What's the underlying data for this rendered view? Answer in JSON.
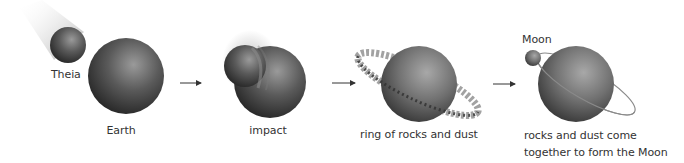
{
  "diagram": {
    "title_visible": false,
    "stages": [
      {
        "id": "earth",
        "label": "Earth",
        "secondary_label": "Theia"
      },
      {
        "id": "impact",
        "label": "impact"
      },
      {
        "id": "ring",
        "label": "ring of rocks and dust"
      },
      {
        "id": "moon",
        "label": "rocks and dust come\ntogether to form the Moon",
        "secondary_label": "Moon"
      }
    ],
    "arrows": [
      {
        "from": "earth",
        "to": "impact"
      },
      {
        "from": "impact",
        "to": "ring"
      },
      {
        "from": "ring",
        "to": "moon"
      }
    ],
    "colors": {
      "sphere_dark": "#1e1e1e",
      "sphere_mid": "#5a5a5a",
      "sphere_light": "#9a9a9a",
      "text": "#333333",
      "arrow": "#333333",
      "orbit": "#8a8a8a"
    }
  }
}
